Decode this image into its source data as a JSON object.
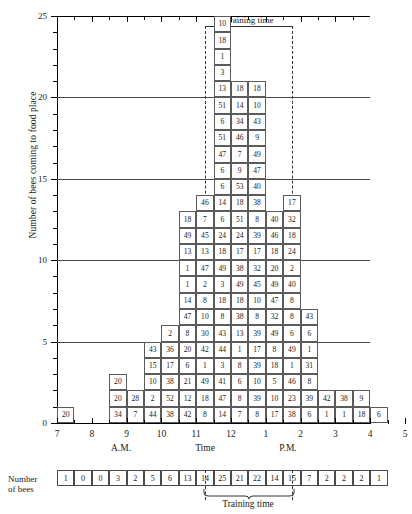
{
  "chart_data": {
    "type": "bar",
    "title": "",
    "xlabel": "Time",
    "ylabel": "Number of bees coming to food place",
    "ylim": [
      0,
      25
    ],
    "yticks": [
      0,
      5,
      10,
      15,
      20,
      25
    ],
    "ytick_labels": [
      "0",
      "5",
      "10",
      "15",
      "20",
      "25"
    ],
    "gridlines": [
      5,
      10,
      15,
      20
    ],
    "xtick_labels": [
      "7",
      "8",
      "9",
      "10",
      "11",
      "12",
      "1",
      "2",
      "3",
      "4",
      "5"
    ],
    "x_period_labels": [
      "A.M.",
      "P.M."
    ],
    "annotations": [
      "Training time"
    ],
    "categories": [
      "7:30",
      "8:00",
      "8:30",
      "9:00",
      "9:30",
      "10:00",
      "10:30",
      "11:00",
      "11:30",
      "12:00",
      "12:30",
      "1:00",
      "1:30",
      "2:00",
      "2:30",
      "3:00",
      "3:30",
      "4:00",
      "4:30"
    ],
    "values": [
      1,
      0,
      0,
      3,
      2,
      5,
      6,
      13,
      14,
      25,
      21,
      22,
      14,
      15,
      7,
      2,
      2,
      2,
      1
    ],
    "bottom_row_label": "Number of bees",
    "bottom_row_values": [
      1,
      0,
      0,
      3,
      2,
      5,
      6,
      13,
      14,
      25,
      21,
      22,
      14,
      15,
      7,
      2,
      2,
      2,
      1
    ],
    "training_time_label": "Training time",
    "training_time_start": "12:30",
    "training_time_end": "3:00",
    "columns": [
      {
        "time": "7:30",
        "bees": [
          "20"
        ]
      },
      {
        "time": "8:00",
        "bees": []
      },
      {
        "time": "8:30",
        "bees": []
      },
      {
        "time": "9:00",
        "bees": [
          "34",
          "20",
          "20"
        ]
      },
      {
        "time": "9:30",
        "bees": [
          "7",
          "28"
        ]
      },
      {
        "time": "10:00",
        "bees": [
          "44",
          "2",
          "10",
          "15",
          "43"
        ]
      },
      {
        "time": "10:30",
        "bees": [
          "38",
          "52",
          "38",
          "17",
          "36",
          "2"
        ]
      },
      {
        "time": "11:00",
        "bees": [
          "42",
          "12",
          "21",
          "6",
          "20",
          "8",
          "47",
          "14",
          "1",
          "1",
          "13",
          "49",
          "18"
        ]
      },
      {
        "time": "11:30",
        "bees": [
          "8",
          "18",
          "49",
          "1",
          "42",
          "30",
          "10",
          "8",
          "2",
          "47",
          "13",
          "45",
          "7",
          "46"
        ]
      },
      {
        "time": "12:00",
        "bees": [
          "14",
          "47",
          "41",
          "3",
          "44",
          "43",
          "8",
          "18",
          "3",
          "49",
          "18",
          "24",
          "6",
          "14",
          "6",
          "6",
          "47",
          "51",
          "6",
          "51",
          "13",
          "3",
          "1",
          "18",
          "10"
        ]
      },
      {
        "time": "12:30",
        "bees": [
          "7",
          "8",
          "6",
          "8",
          "1",
          "13",
          "38",
          "18",
          "49",
          "38",
          "17",
          "24",
          "51",
          "18",
          "53",
          "9",
          "7",
          "46",
          "34",
          "14",
          "18"
        ]
      },
      {
        "time": "1:00",
        "bees": [
          "8",
          "39",
          "10",
          "39",
          "17",
          "39",
          "8",
          "10",
          "45",
          "32",
          "17",
          "39",
          "8",
          "38",
          "40",
          "47",
          "49",
          "9",
          "43",
          "10",
          "18"
        ]
      },
      {
        "time": "1:30",
        "bees": [
          "17",
          "10",
          "5",
          "18",
          "8",
          "49",
          "32",
          "47",
          "49",
          "20",
          "18",
          "46",
          "40"
        ]
      },
      {
        "time": "2:00",
        "bees": [
          "38",
          "23",
          "46",
          "1",
          "49",
          "6",
          "8",
          "8",
          "40",
          "2",
          "24",
          "18",
          "32",
          "17"
        ]
      },
      {
        "time": "2:30",
        "bees": [
          "6",
          "39",
          "8",
          "31",
          "1",
          "6",
          "43"
        ]
      },
      {
        "time": "3:00",
        "bees": [
          "1",
          "42"
        ]
      },
      {
        "time": "3:30",
        "bees": [
          "1",
          "38"
        ]
      },
      {
        "time": "4:00",
        "bees": [
          "18",
          "9"
        ]
      },
      {
        "time": "4:30",
        "bees": [
          "6"
        ]
      }
    ]
  },
  "axis": {
    "y_title": "Number of bees coming to food place",
    "y_ticks": [
      "25",
      "20",
      "15",
      "10",
      "5",
      "0"
    ],
    "x_ticks": [
      "7",
      "8",
      "9",
      "10",
      "11",
      "12",
      "1",
      "2",
      "3",
      "4",
      "5"
    ],
    "am_label": "A.M.",
    "pm_label": "P.M.",
    "time_label": "Time"
  },
  "training": {
    "top_label": "Training time",
    "bottom_label": "Training time"
  },
  "bottom_strip": {
    "label_line1": "Number",
    "label_line2": "of bees",
    "cells": [
      "1",
      "0",
      "0",
      "3",
      "2",
      "5",
      "6",
      "13",
      "14",
      "25",
      "21",
      "22",
      "14",
      "15",
      "7",
      "2",
      "2",
      "2",
      "1"
    ]
  }
}
